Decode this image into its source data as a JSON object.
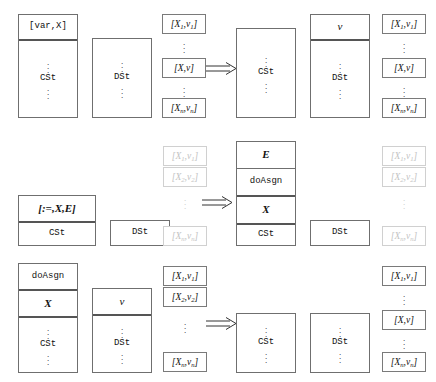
{
  "figure": {
    "type": "rewrite-rule-diagram",
    "arrow_glyph": "double-right-arrow",
    "colors": {
      "stroke": "#6f6f6f",
      "thick_rule": "#555555",
      "faded_stroke": "#d0d0d0",
      "faded_text": "#c3c3c3",
      "text": "#111111",
      "background": "#ffffff"
    },
    "labels": {
      "cst": "CSt",
      "dst": "DSt",
      "var_decl": "[var,X]",
      "assign": "[:=,X,E]",
      "do_asgn": "doAsgn",
      "x": "X",
      "e": "E",
      "v": "v",
      "pair_1": "[X1,v1]",
      "pair_2": "[X2,v2]",
      "pair_x": "[X,v]",
      "pair_n": "[Xn,vn]",
      "ellipsis": "vertical-ellipsis"
    }
  },
  "rules": [
    {
      "id": "rule-var-declaration",
      "name": "var declaration",
      "lhs": {
        "cst_stack": {
          "top_cells": [
            "[var,X]"
          ],
          "body_label": "CSt"
        },
        "dst_stack": {
          "top_cells": [],
          "body_label": "DSt"
        },
        "env_boxes": [
          "[X1,v1]",
          "[X,v]",
          "[Xn,vn]"
        ],
        "env_faded": false
      },
      "rhs": {
        "cst_stack": {
          "top_cells": [],
          "body_label": "CSt"
        },
        "dst_stack": {
          "top_cells": [
            "v"
          ],
          "body_label": "DSt"
        },
        "env_boxes": [
          "[X1,v1]",
          "[X,v]",
          "[Xn,vn]"
        ],
        "env_faded": false
      }
    },
    {
      "id": "rule-assignment",
      "name": "assignment expansion",
      "lhs": {
        "cst_stack": {
          "top_cells": [
            "[:=,X,E]"
          ],
          "body_label": "CSt"
        },
        "dst_stack": {
          "top_cells": [],
          "body_label": "DSt"
        },
        "env_boxes": [
          "[X1,v1]",
          "[X2,v2]",
          "[Xn,vn]"
        ],
        "env_faded": true
      },
      "rhs": {
        "cst_stack": {
          "top_cells": [
            "E",
            "doAsgn",
            "X"
          ],
          "body_label": "CSt"
        },
        "dst_stack": {
          "top_cells": [],
          "body_label": "DSt"
        },
        "env_boxes": [
          "[X1,v1]",
          "[X2,v2]",
          "[Xn,vn]"
        ],
        "env_faded": true
      }
    },
    {
      "id": "rule-do-assign",
      "name": "doAsgn execution",
      "lhs": {
        "cst_stack": {
          "top_cells": [
            "doAsgn",
            "X"
          ],
          "body_label": "CSt"
        },
        "dst_stack": {
          "top_cells": [
            "v"
          ],
          "body_label": "DSt"
        },
        "env_boxes": [
          "[X1,v1]",
          "[X2,v2]",
          "[Xn,vn]"
        ],
        "env_faded": false
      },
      "rhs": {
        "cst_stack": {
          "top_cells": [],
          "body_label": "CSt"
        },
        "dst_stack": {
          "top_cells": [],
          "body_label": "DSt"
        },
        "env_boxes": [
          "[X1,v1]",
          "[X,v]",
          "[Xn,vn]"
        ],
        "env_faded": false
      }
    }
  ],
  "caption_sliver": ""
}
